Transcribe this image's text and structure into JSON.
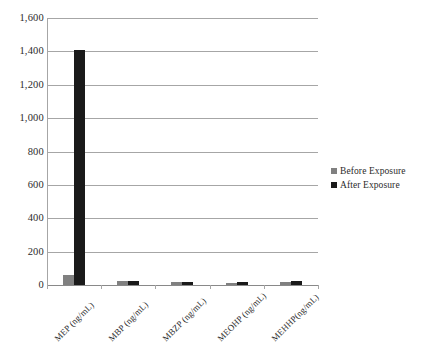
{
  "chart_data": {
    "type": "bar",
    "title": "",
    "subtitle": "",
    "xlabel": "",
    "ylabel": "",
    "categories": [
      "MEP (ng/mL)",
      "MBP (ng/mL)",
      "MBZP (ng/mL)",
      "MEOHP (ng/mL)",
      "MEHHP(ng/mL)"
    ],
    "series": [
      {
        "name": "Before Exposure",
        "color": "#808080",
        "values": [
          60,
          22,
          18,
          14,
          20
        ]
      },
      {
        "name": "After Exposure",
        "color": "#1a1a1a",
        "values": [
          1410,
          25,
          20,
          16,
          24
        ]
      }
    ],
    "ylim": [
      0,
      1600
    ],
    "yticks": [
      0,
      200,
      400,
      600,
      800,
      1000,
      1200,
      1400,
      1600
    ],
    "ytick_labels": [
      "0",
      "200",
      "400",
      "600",
      "800",
      "1,000",
      "1,200",
      "1,400",
      "1,600"
    ],
    "grid": true,
    "grid_axis": "y",
    "legend_position": "right"
  },
  "legend": {
    "items": [
      {
        "label": "Before Exposure",
        "color": "#808080"
      },
      {
        "label": "After Exposure",
        "color": "#1a1a1a"
      }
    ]
  }
}
